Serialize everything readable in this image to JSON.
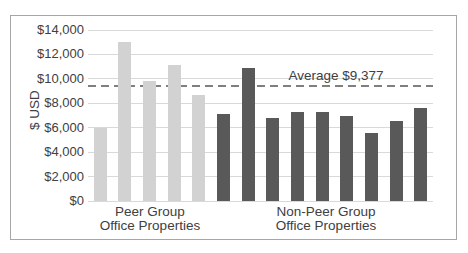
{
  "chart_data": {
    "type": "bar",
    "title": "",
    "ylabel": "$ USD",
    "xlabel": "",
    "ylim": [
      0,
      14000
    ],
    "grid": true,
    "legend": "none",
    "yticks": [
      {
        "value": 0,
        "label": "$0"
      },
      {
        "value": 2000,
        "label": "$2,000"
      },
      {
        "value": 4000,
        "label": "$4,000"
      },
      {
        "value": 6000,
        "label": "$6,000"
      },
      {
        "value": 8000,
        "label": "$8,000"
      },
      {
        "value": 10000,
        "label": "$10,000"
      },
      {
        "value": 12000,
        "label": "$12,000"
      },
      {
        "value": 14000,
        "label": "$14,000"
      }
    ],
    "series": [
      {
        "name": "Peer Group Office Properties",
        "color": "#d2d2d2",
        "values": [
          6000,
          13000,
          9850,
          11150,
          8650
        ]
      },
      {
        "name": "Non-Peer Group Office Properties",
        "color": "#595959",
        "values": [
          7150,
          10900,
          6800,
          7300,
          7300,
          7000,
          5600,
          6550,
          7600
        ]
      }
    ],
    "x_groups": [
      {
        "line1": "Peer Group",
        "line2": "Office Properties"
      },
      {
        "line1": "Non-Peer Group",
        "line2": "Office Properties"
      }
    ],
    "average_line": {
      "label": "Average $9,377",
      "value": 9377,
      "color": "#7f7f7f",
      "style": "dashed"
    }
  },
  "colors": {
    "background": "#ffffff",
    "chart_border": "#a6a6a6",
    "gridline": "#d9d9d9",
    "text": "#404040",
    "peer_bar": "#d2d2d2",
    "nonpeer_bar": "#595959",
    "average_line": "#7f7f7f"
  }
}
